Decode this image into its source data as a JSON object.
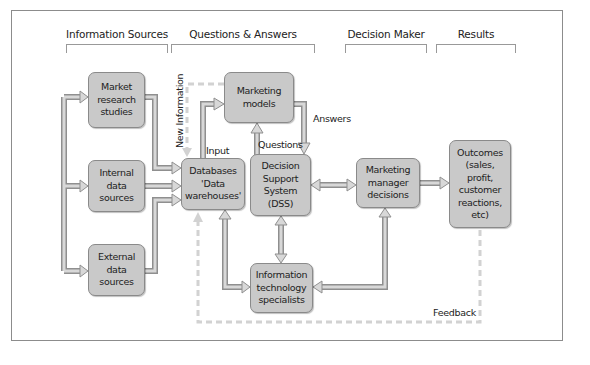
{
  "headers": [
    {
      "id": "information-sources",
      "label": "Information Sources"
    },
    {
      "id": "questions-answers",
      "label": "Questions & Answers"
    },
    {
      "id": "decision-maker",
      "label": "Decision Maker"
    },
    {
      "id": "results",
      "label": "Results"
    }
  ],
  "nodes": {
    "market_research": "Market\nresearch\nstudies",
    "internal_data": "Internal\ndata\nsources",
    "external_data": "External\ndata\nsources",
    "databases": "Databases\n'Data\nwarehouses'",
    "marketing_models": "Marketing\nmodels",
    "dss": "Decision\nSupport\nSystem\n(DSS)",
    "it_specialists": "Information\ntechnology\nspecialists",
    "marketing_manager": "Marketing\nmanager\ndecisions",
    "outcomes": "Outcomes\n(sales,\nprofit,\ncustomer\nreactions,\netc)"
  },
  "edge_labels": {
    "new_information": "New Information",
    "input": "Input",
    "questions": "Questions",
    "answers": "Answers",
    "feedback": "Feedback"
  },
  "colors": {
    "box_fill": "#c9c9c9",
    "box_border": "#8a8a8a",
    "arrow_fill": "#d4d4d4",
    "arrow_stroke": "#8f8f8f",
    "dashed_line": "#d0d0d0"
  }
}
